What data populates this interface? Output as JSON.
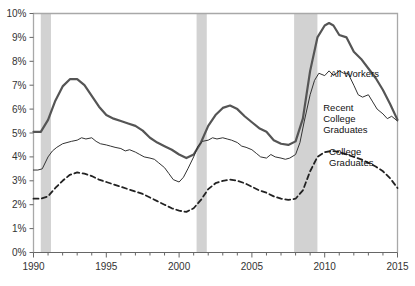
{
  "chart_data": {
    "type": "line",
    "title": "",
    "subtitle": "",
    "xlabel": "",
    "ylabel": "",
    "xlim": [
      1990,
      2015
    ],
    "ylim": [
      0,
      10
    ],
    "grid": false,
    "legend_position": "inline-annotations",
    "y_ticks": [
      "0%",
      "1%",
      "2%",
      "3%",
      "4%",
      "5%",
      "6%",
      "7%",
      "8%",
      "9%",
      "10%"
    ],
    "y_tick_values": [
      0,
      1,
      2,
      3,
      4,
      5,
      6,
      7,
      8,
      9,
      10
    ],
    "x_ticks": [
      "1990",
      "1995",
      "2000",
      "2005",
      "2010",
      "2015"
    ],
    "x_tick_values": [
      1990,
      1995,
      2000,
      2005,
      2010,
      2015
    ],
    "x_minor_step": 1,
    "shaded_regions": [
      {
        "name": "recession-1990",
        "start": 1990.5,
        "end": 1991.2
      },
      {
        "name": "recession-2001",
        "start": 2001.2,
        "end": 2001.9
      },
      {
        "name": "recession-2008",
        "start": 2007.9,
        "end": 2009.5
      }
    ],
    "colors": {
      "all_workers": "#555555",
      "recent_college_graduates": "#444444",
      "college_graduates": "#333333",
      "recession_band": "#d2d2d2",
      "axis": "#999999",
      "tick_text": "#444444"
    },
    "series": [
      {
        "name": "All Workers",
        "style": "solid-thick",
        "label_x": 2010.4,
        "label_y": 7.35,
        "x": [
          1990.0,
          1990.5,
          1991.0,
          1991.5,
          1992.0,
          1992.5,
          1993.0,
          1993.5,
          1994.0,
          1994.5,
          1995.0,
          1995.5,
          1996.0,
          1996.5,
          1997.0,
          1997.5,
          1998.0,
          1998.5,
          1999.0,
          1999.5,
          2000.0,
          2000.5,
          2001.0,
          2001.5,
          2002.0,
          2002.5,
          2003.0,
          2003.5,
          2004.0,
          2004.5,
          2005.0,
          2005.5,
          2006.0,
          2006.5,
          2007.0,
          2007.5,
          2008.0,
          2008.5,
          2009.0,
          2009.5,
          2010.0,
          2010.3,
          2010.6,
          2011.0,
          2011.5,
          2012.0,
          2012.5,
          2013.0,
          2013.5,
          2014.0,
          2014.5,
          2015.0
        ],
        "y": [
          5.05,
          5.05,
          5.55,
          6.35,
          6.95,
          7.25,
          7.25,
          7.0,
          6.55,
          6.1,
          5.75,
          5.6,
          5.5,
          5.4,
          5.3,
          5.1,
          4.8,
          4.6,
          4.45,
          4.3,
          4.1,
          3.95,
          4.1,
          4.6,
          5.3,
          5.75,
          6.05,
          6.15,
          6.0,
          5.7,
          5.45,
          5.2,
          5.05,
          4.7,
          4.55,
          4.5,
          4.65,
          5.6,
          7.6,
          9.0,
          9.5,
          9.6,
          9.5,
          9.1,
          9.0,
          8.4,
          8.1,
          7.7,
          7.3,
          6.8,
          6.2,
          5.55
        ]
      },
      {
        "name": "Recent College Graduates",
        "style": "solid-thin",
        "label_x": 2009.9,
        "label_y": 5.9,
        "x": [
          1990.0,
          1990.3,
          1990.6,
          1991.0,
          1991.3,
          1991.6,
          1992.0,
          1992.3,
          1992.6,
          1993.0,
          1993.3,
          1993.6,
          1994.0,
          1994.3,
          1994.6,
          1995.0,
          1995.3,
          1995.6,
          1996.0,
          1996.3,
          1996.6,
          1997.0,
          1997.3,
          1997.6,
          1998.0,
          1998.3,
          1998.6,
          1999.0,
          1999.3,
          1999.6,
          2000.0,
          2000.3,
          2000.6,
          2001.0,
          2001.3,
          2001.6,
          2002.0,
          2002.3,
          2002.6,
          2003.0,
          2003.3,
          2003.6,
          2004.0,
          2004.3,
          2004.6,
          2005.0,
          2005.3,
          2005.6,
          2006.0,
          2006.3,
          2006.6,
          2007.0,
          2007.3,
          2007.6,
          2008.0,
          2008.3,
          2008.6,
          2009.0,
          2009.3,
          2009.6,
          2010.0,
          2010.3,
          2010.6,
          2011.0,
          2011.3,
          2011.6,
          2012.0,
          2012.3,
          2012.6,
          2013.0,
          2013.3,
          2013.6,
          2014.0,
          2014.3,
          2014.6,
          2015.0
        ],
        "y": [
          3.45,
          3.45,
          3.5,
          4.0,
          4.25,
          4.4,
          4.55,
          4.6,
          4.65,
          4.7,
          4.8,
          4.75,
          4.8,
          4.65,
          4.55,
          4.5,
          4.45,
          4.4,
          4.35,
          4.25,
          4.3,
          4.2,
          4.1,
          4.0,
          3.95,
          3.9,
          3.75,
          3.55,
          3.3,
          3.05,
          2.95,
          3.15,
          3.5,
          4.0,
          4.45,
          4.65,
          4.7,
          4.8,
          4.75,
          4.8,
          4.75,
          4.7,
          4.6,
          4.45,
          4.4,
          4.3,
          4.15,
          4.0,
          3.95,
          4.1,
          4.0,
          3.95,
          3.9,
          3.95,
          4.1,
          4.6,
          5.5,
          6.6,
          7.2,
          7.5,
          7.4,
          7.6,
          7.4,
          7.6,
          7.5,
          7.5,
          7.0,
          6.6,
          6.5,
          6.6,
          6.3,
          6.0,
          5.8,
          5.6,
          5.7,
          5.5
        ]
      },
      {
        "name": "College Graduates",
        "style": "dashed",
        "label_x": 2010.3,
        "label_y": 4.1,
        "x": [
          1990.0,
          1990.5,
          1991.0,
          1991.5,
          1992.0,
          1992.5,
          1993.0,
          1993.5,
          1994.0,
          1994.5,
          1995.0,
          1995.5,
          1996.0,
          1996.5,
          1997.0,
          1997.5,
          1998.0,
          1998.5,
          1999.0,
          1999.5,
          2000.0,
          2000.5,
          2001.0,
          2001.5,
          2002.0,
          2002.5,
          2003.0,
          2003.5,
          2004.0,
          2004.5,
          2005.0,
          2005.5,
          2006.0,
          2006.5,
          2007.0,
          2007.5,
          2008.0,
          2008.5,
          2009.0,
          2009.5,
          2010.0,
          2010.5,
          2011.0,
          2011.5,
          2012.0,
          2012.5,
          2013.0,
          2013.5,
          2014.0,
          2014.5,
          2015.0
        ],
        "y": [
          2.25,
          2.25,
          2.35,
          2.7,
          3.0,
          3.25,
          3.35,
          3.3,
          3.2,
          3.05,
          2.95,
          2.85,
          2.75,
          2.65,
          2.55,
          2.45,
          2.3,
          2.15,
          2.0,
          1.85,
          1.75,
          1.7,
          1.85,
          2.2,
          2.65,
          2.9,
          3.0,
          3.05,
          3.0,
          2.9,
          2.75,
          2.6,
          2.5,
          2.35,
          2.25,
          2.2,
          2.25,
          2.6,
          3.4,
          4.0,
          4.2,
          4.25,
          4.2,
          4.1,
          4.0,
          3.9,
          3.75,
          3.6,
          3.4,
          3.1,
          2.7
        ]
      }
    ]
  },
  "annotations": {
    "all_workers_label": "All Workers",
    "recent_grads_line1": "Recent",
    "recent_grads_line2": "College",
    "recent_grads_line3": "Graduates",
    "college_grads_line1": "College",
    "college_grads_line2": "Graduates"
  }
}
